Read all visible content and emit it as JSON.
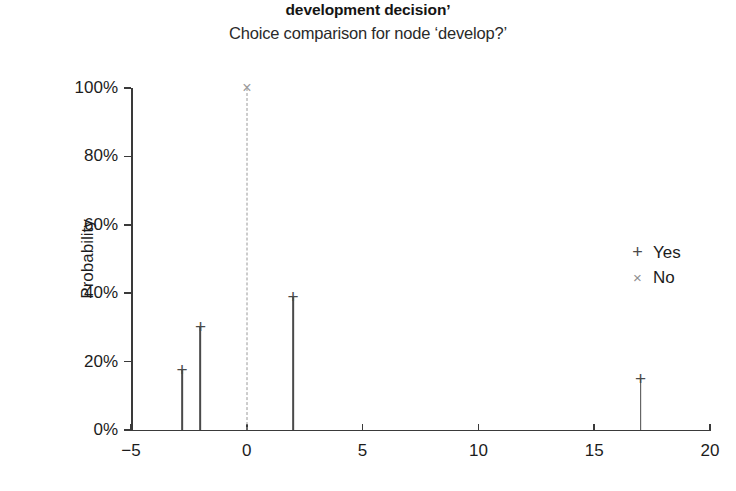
{
  "header": {
    "title": "development decision’",
    "subtitle": "Choice comparison for node ‘develop?’"
  },
  "axes": {
    "ylabel": "Probability",
    "xlabel": "",
    "yticks": [
      "0%",
      "20%",
      "40%",
      "60%",
      "80%",
      "100%"
    ],
    "xticks": [
      "−5",
      "0",
      "5",
      "10",
      "15",
      "20"
    ]
  },
  "legend": {
    "items": [
      {
        "symbol": "+",
        "label": "Yes",
        "symbol_name": "plus-marker"
      },
      {
        "symbol": "×",
        "label": "No",
        "symbol_name": "cross-marker"
      }
    ]
  },
  "chart_data": {
    "type": "scatter",
    "title": "development decision’",
    "subtitle": "Choice comparison for node ‘develop?’",
    "xlabel": "",
    "ylabel": "Probability",
    "xlim": [
      -5,
      20
    ],
    "ylim": [
      0,
      1
    ],
    "ytick_values": [
      0,
      0.2,
      0.4,
      0.6,
      0.8,
      1.0
    ],
    "ytick_labels": [
      "0%",
      "20%",
      "40%",
      "60%",
      "80%",
      "100%"
    ],
    "xtick_values": [
      -5,
      0,
      5,
      10,
      15,
      20
    ],
    "xtick_labels": [
      "−5",
      "0",
      "5",
      "10",
      "15",
      "20"
    ],
    "grid": false,
    "legend_position": "right",
    "series": [
      {
        "name": "Yes",
        "marker": "+",
        "color": "#4a4a4a",
        "linestyle": "solid",
        "points": [
          {
            "x": -2.8,
            "y": 0.175
          },
          {
            "x": -2.0,
            "y": 0.3
          },
          {
            "x": 2.0,
            "y": 0.39
          },
          {
            "x": 17.0,
            "y": 0.148
          }
        ]
      },
      {
        "name": "No",
        "marker": "×",
        "color": "#9a9a9a",
        "linestyle": "dashed",
        "points": [
          {
            "x": 0.0,
            "y": 1.0
          }
        ]
      }
    ]
  }
}
